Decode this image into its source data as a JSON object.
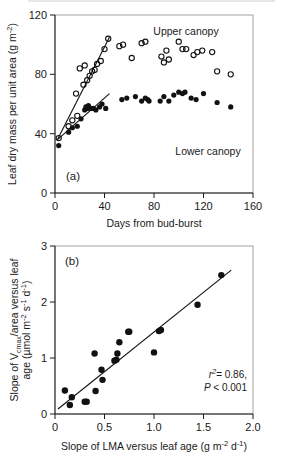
{
  "figure": {
    "panels": [
      {
        "id": "a",
        "letter": "(a)",
        "xlabel": "Days from bud-burst",
        "ylabel": "Leaf dry mass per unit area (g m",
        "ylabel_sup": "-2",
        "ylabel_tail": ")",
        "series_labels": {
          "upper": "Upper canopy",
          "lower": "Lower canopy"
        }
      },
      {
        "id": "b",
        "letter": "(b)",
        "xlabel_main": "Slope of LMA versus leaf age (g m",
        "xlabel_sup1": "-2",
        "xlabel_mid": " d",
        "xlabel_sup2": "-1",
        "xlabel_tail": ")",
        "ylabel_line1_a": "Slope of V",
        "ylabel_line1_sub": "cmax",
        "ylabel_line1_b": "/area versus leaf",
        "ylabel_line2_a": "age (",
        "ylabel_line2_mu": "µmol m",
        "ylabel_line2_sup1": "-2",
        "ylabel_line2_s": " s",
        "ylabel_line2_sup2": "-1",
        "ylabel_line2_d": " d",
        "ylabel_line2_sup3": "-1",
        "ylabel_line2_tail": ")",
        "stats": {
          "r2_symbol": "r",
          "r2_sup": "2",
          "r2_value": "= 0.86,",
          "p_symbol": "P",
          "p_value": "< 0.001"
        }
      }
    ]
  },
  "chart_data": [
    {
      "type": "scatter",
      "panel": "a",
      "title": "",
      "xlabel": "Days from bud-burst",
      "ylabel": "Leaf dry mass per unit area (g m-2)",
      "xlim": [
        0,
        160
      ],
      "ylim": [
        0,
        120
      ],
      "xticks": [
        0,
        40,
        80,
        120,
        160
      ],
      "yticks": [
        0,
        40,
        80,
        120
      ],
      "grid": false,
      "legend": "in-plot annotations",
      "series": [
        {
          "name": "Upper canopy",
          "marker": "open-circle",
          "points": [
            [
              3,
              37
            ],
            [
              11,
              45
            ],
            [
              14,
              49
            ],
            [
              17,
              67
            ],
            [
              18,
              52
            ],
            [
              20,
              84
            ],
            [
              23,
              73
            ],
            [
              24,
              86
            ],
            [
              26,
              76
            ],
            [
              28,
              79
            ],
            [
              30,
              82
            ],
            [
              32,
              83
            ],
            [
              34,
              87
            ],
            [
              37,
              89
            ],
            [
              40,
              97
            ],
            [
              43,
              104
            ],
            [
              52,
              99
            ],
            [
              55,
              100
            ],
            [
              62,
              91
            ],
            [
              70,
              101
            ],
            [
              73,
              102
            ],
            [
              86,
              92
            ],
            [
              88,
              88
            ],
            [
              90,
              96
            ],
            [
              92,
              90
            ],
            [
              100,
              102
            ],
            [
              103,
              97
            ],
            [
              106,
              97
            ],
            [
              112,
              93
            ],
            [
              115,
              95
            ],
            [
              119,
              96
            ],
            [
              127,
              95
            ],
            [
              131,
              82
            ],
            [
              142,
              80
            ]
          ],
          "fit_line": {
            "x": [
              2,
              44
            ],
            "y": [
              36,
              105
            ]
          }
        },
        {
          "name": "Lower canopy",
          "marker": "filled-circle",
          "points": [
            [
              3,
              32
            ],
            [
              11,
              41
            ],
            [
              14,
              44
            ],
            [
              18,
              45
            ],
            [
              21,
              50
            ],
            [
              24,
              56
            ],
            [
              25,
              58
            ],
            [
              26,
              57
            ],
            [
              27,
              59
            ],
            [
              29,
              57
            ],
            [
              31,
              57
            ],
            [
              33,
              56
            ],
            [
              36,
              58
            ],
            [
              38,
              60
            ],
            [
              41,
              57
            ],
            [
              54,
              63
            ],
            [
              58,
              64
            ],
            [
              65,
              65
            ],
            [
              70,
              62
            ],
            [
              73,
              64
            ],
            [
              75,
              63
            ],
            [
              76,
              62
            ],
            [
              85,
              62
            ],
            [
              88,
              65
            ],
            [
              92,
              62
            ],
            [
              96,
              66
            ],
            [
              100,
              68
            ],
            [
              103,
              67
            ],
            [
              105,
              68
            ],
            [
              110,
              64
            ],
            [
              114,
              63
            ],
            [
              120,
              67
            ],
            [
              131,
              61
            ],
            [
              142,
              58
            ]
          ],
          "fit_line": {
            "x": [
              2,
              44
            ],
            "y": [
              36,
              67
            ]
          }
        }
      ]
    },
    {
      "type": "scatter",
      "panel": "b",
      "title": "",
      "xlabel": "Slope of LMA versus leaf age (g m-2 d-1)",
      "ylabel": "Slope of Vcmax/area versus leaf age (umol m-2 s-1 d-1)",
      "xlim": [
        0,
        2.0
      ],
      "ylim": [
        0,
        3
      ],
      "xticks": [
        0,
        0.5,
        1.0,
        1.5,
        2.0
      ],
      "yticks": [
        0,
        1,
        2,
        3
      ],
      "grid": false,
      "annotations": [
        "r2= 0.86,",
        "P < 0.001"
      ],
      "series": [
        {
          "name": "Slope relationship",
          "marker": "filled-circle",
          "points": [
            [
              0.1,
              0.42
            ],
            [
              0.15,
              0.16
            ],
            [
              0.17,
              0.3
            ],
            [
              0.3,
              0.22
            ],
            [
              0.32,
              0.22
            ],
            [
              0.4,
              1.08
            ],
            [
              0.41,
              0.41
            ],
            [
              0.47,
              0.79
            ],
            [
              0.48,
              0.61
            ],
            [
              0.6,
              0.95
            ],
            [
              0.62,
              0.97
            ],
            [
              0.63,
              1.08
            ],
            [
              0.65,
              1.28
            ],
            [
              0.74,
              1.47
            ],
            [
              0.75,
              1.47
            ],
            [
              1.0,
              1.1
            ],
            [
              1.05,
              1.48
            ],
            [
              1.07,
              1.5
            ],
            [
              1.44,
              1.95
            ],
            [
              1.68,
              2.48
            ]
          ],
          "fit_line": {
            "x": [
              0.03,
              1.78
            ],
            "y": [
              0.09,
              2.57
            ]
          }
        }
      ]
    }
  ]
}
